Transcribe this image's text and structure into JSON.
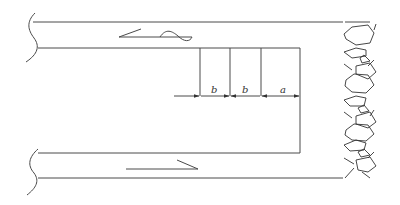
{
  "diagram": {
    "type": "mining-panel-plan",
    "colors": {
      "line": "#4a4a4a",
      "background": "#ffffff"
    },
    "dimensions": [
      {
        "label": "b",
        "from_x": 200,
        "to_x": 230
      },
      {
        "label": "b",
        "from_x": 230,
        "to_x": 261
      },
      {
        "label": "a",
        "from_x": 261,
        "to_x": 300
      }
    ],
    "labels": {
      "dim1": "b",
      "dim2": "b",
      "dim3": "a"
    },
    "airflow": {
      "top": "intake-flow-arrow",
      "bottom": "return-flow-arrow"
    },
    "gob": "caved-rock-zone"
  }
}
